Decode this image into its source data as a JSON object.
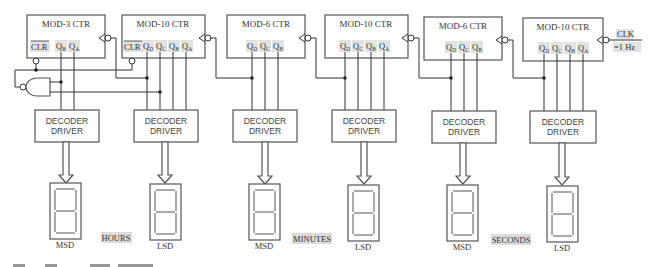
{
  "diagram": {
    "type": "digital-clock-block-diagram",
    "clock": {
      "label": "CLK",
      "frequency": "=1 Hz"
    },
    "counters": [
      {
        "id": "hours-tens",
        "title": "MOD-3 CTR",
        "clr": "CLR",
        "outputs": [
          "Q",
          "Q"
        ],
        "subs": [
          "B",
          "A"
        ]
      },
      {
        "id": "hours-units",
        "title": "MOD-10 CTR",
        "clr": "CLR",
        "outputs": [
          "Q",
          "Q",
          "Q",
          "Q"
        ],
        "subs": [
          "D",
          "C",
          "B",
          "A"
        ]
      },
      {
        "id": "minutes-tens",
        "title": "MOD-6 CTR",
        "outputs": [
          "Q",
          "Q",
          "Q"
        ],
        "subs": [
          "D",
          "C",
          "B"
        ]
      },
      {
        "id": "minutes-units",
        "title": "MOD-10 CTR",
        "outputs": [
          "Q",
          "Q",
          "Q",
          "Q"
        ],
        "subs": [
          "D",
          "C",
          "B",
          "A"
        ]
      },
      {
        "id": "seconds-tens",
        "title": "MOD-6 CTR",
        "outputs": [
          "Q",
          "Q",
          "Q"
        ],
        "subs": [
          "D",
          "C",
          "B"
        ]
      },
      {
        "id": "seconds-units",
        "title": "MOD-10 CTR",
        "outputs": [
          "Q",
          "Q",
          "Q",
          "Q"
        ],
        "subs": [
          "D",
          "C",
          "B",
          "A"
        ]
      }
    ],
    "decoders": [
      {
        "line1": "DECODER",
        "line2": "DRIVER"
      },
      {
        "line1": "DECODER",
        "line2": "DRIVER"
      },
      {
        "line1": "DECODER",
        "line2": "DRIVER"
      },
      {
        "line1": "DECODER",
        "line2": "DRIVER"
      },
      {
        "line1": "DECODER",
        "line2": "DRIVER"
      },
      {
        "line1": "DECODER",
        "line2": "DRIVER"
      }
    ],
    "displays": [
      {
        "label": "MSD"
      },
      {
        "label": "LSD"
      },
      {
        "label": "MSD"
      },
      {
        "label": "LSD"
      },
      {
        "label": "MSD"
      },
      {
        "label": "LSD"
      }
    ],
    "groups": [
      {
        "label": "HOURS"
      },
      {
        "label": "MINUTES"
      },
      {
        "label": "SECONDS"
      }
    ],
    "gate": {
      "type": "AND-with-inverted-output"
    }
  }
}
